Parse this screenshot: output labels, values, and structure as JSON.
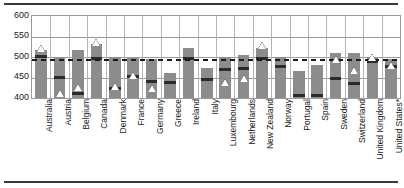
{
  "chart_data": {
    "type": "bar",
    "title": "",
    "subtitle": "",
    "xlabel": "",
    "ylabel": "",
    "ylim": [
      400,
      600
    ],
    "yticks": [
      400,
      450,
      500,
      550,
      600
    ],
    "grid": true,
    "legend_position": "none",
    "bar_style": "floating-range",
    "reference_line": {
      "label": "OECD average",
      "value": 493
    },
    "categories": [
      "Australia",
      "Austria",
      "Belgium",
      "Canada",
      "Denmark",
      "France",
      "Germany",
      "Greece",
      "Ireland",
      "Italy",
      "Luxembourg",
      "Netherlands",
      "New Zealand",
      "Norway",
      "Portugal",
      "Spain",
      "Sweden",
      "Switzerland",
      "United Kingdom",
      "United States*"
    ],
    "series": [
      {
        "name": "Range (low to high)",
        "low": [
          400,
          400,
          400,
          400,
          400,
          400,
          400,
          400,
          400,
          400,
          400,
          400,
          400,
          400,
          400,
          400,
          400,
          400,
          400,
          400
        ],
        "high": [
          517,
          499,
          516,
          532,
          500,
          498,
          495,
          462,
          521,
          473,
          500,
          505,
          522,
          499,
          466,
          481,
          509,
          510,
          500,
          494
        ]
      },
      {
        "name": "Median band",
        "values": [
          501,
          451,
          412,
          497,
          423,
          453,
          441,
          437,
          497,
          444,
          469,
          472,
          497,
          476,
          406,
          405,
          448,
          435,
          489,
          478
        ]
      },
      {
        "name": "Mean marker (triangle)",
        "values": [
          521,
          410,
          425,
          536,
          428,
          456,
          424,
          null,
          null,
          null,
          437,
          448,
          529,
          null,
          null,
          null,
          493,
          468,
          499,
          479
        ]
      }
    ]
  },
  "notes": {
    "footnote": "United States*"
  }
}
